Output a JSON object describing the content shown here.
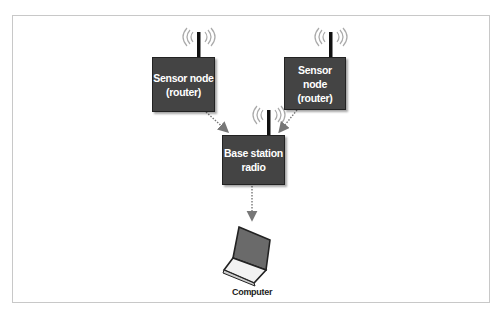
{
  "diagram": {
    "nodes": {
      "sensor_left": {
        "line1": "Sensor node",
        "line2": "(router)"
      },
      "sensor_right": {
        "line1": "Sensor node",
        "line2": "(router)"
      },
      "base_station": {
        "line1": "Base station",
        "line2": "radio"
      },
      "computer": {
        "label": "Computer"
      }
    },
    "edges": [
      {
        "from": "sensor_left",
        "to": "base_station",
        "style": "dotted-arrow"
      },
      {
        "from": "sensor_right",
        "to": "base_station",
        "style": "dotted-arrow"
      },
      {
        "from": "base_station",
        "to": "computer",
        "style": "dotted-arrow"
      }
    ],
    "colors": {
      "node_fill": "#444444",
      "node_text": "#ffffff",
      "arrow": "#777777",
      "frame": "#c8c8c8"
    }
  }
}
